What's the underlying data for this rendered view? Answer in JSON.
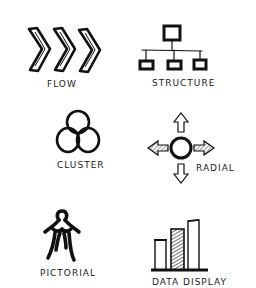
{
  "diagram": {
    "type": "icon-grid",
    "layout": {
      "columns": 2,
      "rows": 3
    },
    "items": [
      {
        "label": "FLOW",
        "icon": "triple-chevron-right-icon"
      },
      {
        "label": "STRUCTURE",
        "icon": "org-chart-hierarchy-icon"
      },
      {
        "label": "CLUSTER",
        "icon": "three-overlapping-circles-icon"
      },
      {
        "label": "RADIAL",
        "icon": "circle-with-four-arrows-icon"
      },
      {
        "label": "PICTORIAL",
        "icon": "human-figure-icon"
      },
      {
        "label": "DATA DISPLAY",
        "icon": "bar-chart-icon"
      }
    ],
    "colors": {
      "ink": "#111111",
      "background": "#ffffff",
      "hatch": "#555555"
    }
  }
}
